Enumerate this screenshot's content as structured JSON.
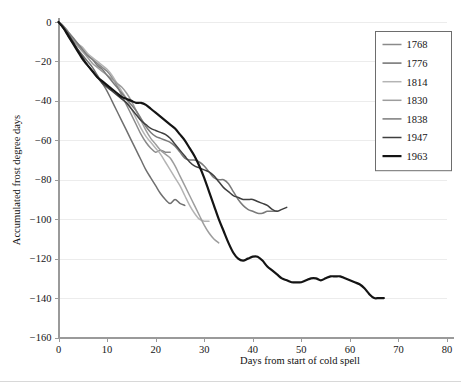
{
  "chart_data": {
    "type": "line",
    "title": "",
    "xlabel": "Days from start of cold spell",
    "ylabel": "Accumulated frost degree days",
    "xlim": [
      0,
      80
    ],
    "ylim": [
      -160,
      0
    ],
    "xticks": [
      0,
      10,
      20,
      30,
      40,
      50,
      60,
      70,
      80
    ],
    "yticks": [
      0,
      -20,
      -40,
      -60,
      -80,
      -100,
      -120,
      -140,
      -160
    ],
    "xtick_labels": [
      "0",
      "10",
      "20",
      "30",
      "40",
      "50",
      "60",
      "70",
      "80"
    ],
    "ytick_labels": [
      "0",
      "-20",
      "-40",
      "-60",
      "-80",
      "-100",
      "-120",
      "-140",
      "-160"
    ],
    "grid": "horizontal",
    "legend_position": "top-right",
    "series": [
      {
        "name": "1768",
        "color": "#8a8a8a",
        "width": 1.5,
        "points": [
          [
            0,
            0
          ],
          [
            1,
            -3
          ],
          [
            2,
            -6
          ],
          [
            3,
            -9
          ],
          [
            4,
            -12
          ],
          [
            5,
            -15
          ],
          [
            6,
            -17
          ],
          [
            7,
            -19
          ],
          [
            8,
            -21
          ],
          [
            9,
            -23
          ],
          [
            10,
            -25
          ],
          [
            11,
            -28
          ],
          [
            12,
            -32
          ],
          [
            13,
            -37
          ],
          [
            14,
            -42
          ],
          [
            15,
            -47
          ],
          [
            16,
            -52
          ],
          [
            17,
            -57
          ],
          [
            18,
            -61
          ],
          [
            19,
            -64
          ],
          [
            20,
            -66
          ],
          [
            21,
            -65
          ],
          [
            22,
            -66
          ],
          [
            23,
            -66
          ]
        ]
      },
      {
        "name": "1776",
        "color": "#6f6f6f",
        "width": 1.5,
        "points": [
          [
            0,
            0
          ],
          [
            1,
            -3
          ],
          [
            2,
            -7
          ],
          [
            3,
            -11
          ],
          [
            4,
            -14
          ],
          [
            5,
            -17
          ],
          [
            6,
            -20
          ],
          [
            7,
            -23
          ],
          [
            8,
            -27
          ],
          [
            9,
            -31
          ],
          [
            10,
            -35
          ],
          [
            11,
            -40
          ],
          [
            12,
            -45
          ],
          [
            13,
            -50
          ],
          [
            14,
            -55
          ],
          [
            15,
            -60
          ],
          [
            16,
            -65
          ],
          [
            17,
            -70
          ],
          [
            18,
            -75
          ],
          [
            19,
            -79
          ],
          [
            20,
            -83
          ],
          [
            21,
            -87
          ],
          [
            22,
            -90
          ],
          [
            23,
            -92
          ],
          [
            24,
            -90
          ],
          [
            25,
            -92
          ],
          [
            26,
            -93
          ]
        ]
      },
      {
        "name": "1814",
        "color": "#b4b4b4",
        "width": 1.5,
        "points": [
          [
            0,
            0
          ],
          [
            1,
            -2
          ],
          [
            2,
            -5
          ],
          [
            3,
            -8
          ],
          [
            4,
            -11
          ],
          [
            5,
            -13
          ],
          [
            6,
            -16
          ],
          [
            7,
            -18
          ],
          [
            8,
            -20
          ],
          [
            9,
            -22
          ],
          [
            10,
            -24
          ],
          [
            11,
            -27
          ],
          [
            12,
            -31
          ],
          [
            13,
            -35
          ],
          [
            14,
            -39
          ],
          [
            15,
            -44
          ],
          [
            16,
            -49
          ],
          [
            17,
            -54
          ],
          [
            18,
            -58
          ],
          [
            19,
            -61
          ],
          [
            20,
            -64
          ],
          [
            21,
            -67
          ],
          [
            22,
            -71
          ],
          [
            23,
            -75
          ],
          [
            24,
            -79
          ],
          [
            25,
            -83
          ],
          [
            26,
            -88
          ],
          [
            27,
            -93
          ],
          [
            28,
            -97
          ],
          [
            29,
            -100
          ],
          [
            30,
            -101
          ],
          [
            31,
            -101
          ]
        ]
      },
      {
        "name": "1830",
        "color": "#9d9d9d",
        "width": 1.5,
        "points": [
          [
            0,
            0
          ],
          [
            1,
            -3
          ],
          [
            2,
            -6
          ],
          [
            3,
            -9
          ],
          [
            4,
            -12
          ],
          [
            5,
            -15
          ],
          [
            6,
            -18
          ],
          [
            7,
            -21
          ],
          [
            8,
            -23
          ],
          [
            9,
            -25
          ],
          [
            10,
            -27
          ],
          [
            11,
            -29
          ],
          [
            12,
            -31
          ],
          [
            13,
            -33
          ],
          [
            14,
            -36
          ],
          [
            15,
            -40
          ],
          [
            16,
            -45
          ],
          [
            17,
            -50
          ],
          [
            18,
            -55
          ],
          [
            19,
            -59
          ],
          [
            20,
            -62
          ],
          [
            21,
            -65
          ],
          [
            22,
            -67
          ],
          [
            23,
            -69
          ],
          [
            24,
            -73
          ],
          [
            25,
            -78
          ],
          [
            26,
            -83
          ],
          [
            27,
            -88
          ],
          [
            28,
            -93
          ],
          [
            29,
            -98
          ],
          [
            30,
            -103
          ],
          [
            31,
            -107
          ],
          [
            32,
            -110
          ],
          [
            33,
            -112
          ]
        ]
      },
      {
        "name": "1838",
        "color": "#7b7b7b",
        "width": 1.5,
        "points": [
          [
            0,
            0
          ],
          [
            1,
            -2
          ],
          [
            2,
            -5
          ],
          [
            3,
            -8
          ],
          [
            4,
            -11
          ],
          [
            5,
            -14
          ],
          [
            6,
            -17
          ],
          [
            7,
            -19
          ],
          [
            8,
            -22
          ],
          [
            9,
            -24
          ],
          [
            10,
            -27
          ],
          [
            11,
            -30
          ],
          [
            12,
            -33
          ],
          [
            13,
            -36
          ],
          [
            14,
            -39
          ],
          [
            15,
            -42
          ],
          [
            16,
            -45
          ],
          [
            17,
            -49
          ],
          [
            18,
            -53
          ],
          [
            19,
            -56
          ],
          [
            20,
            -58
          ],
          [
            21,
            -59
          ],
          [
            22,
            -60
          ],
          [
            23,
            -61
          ],
          [
            24,
            -63
          ],
          [
            25,
            -66
          ],
          [
            26,
            -69
          ],
          [
            27,
            -70
          ],
          [
            28,
            -70
          ],
          [
            29,
            -71
          ],
          [
            30,
            -73
          ],
          [
            31,
            -76
          ],
          [
            32,
            -79
          ],
          [
            33,
            -80
          ],
          [
            34,
            -80
          ],
          [
            35,
            -82
          ],
          [
            36,
            -86
          ],
          [
            37,
            -90
          ],
          [
            38,
            -93
          ],
          [
            39,
            -95
          ],
          [
            40,
            -96
          ],
          [
            41,
            -97
          ],
          [
            42,
            -97
          ],
          [
            43,
            -96
          ],
          [
            44,
            -96
          ],
          [
            45,
            -96
          ]
        ]
      },
      {
        "name": "1947",
        "color": "#3f3f3f",
        "width": 1.5,
        "points": [
          [
            0,
            0
          ],
          [
            1,
            -3
          ],
          [
            2,
            -6
          ],
          [
            3,
            -10
          ],
          [
            4,
            -14
          ],
          [
            5,
            -18
          ],
          [
            6,
            -22
          ],
          [
            7,
            -25
          ],
          [
            8,
            -28
          ],
          [
            9,
            -31
          ],
          [
            10,
            -33
          ],
          [
            11,
            -35
          ],
          [
            12,
            -37
          ],
          [
            13,
            -39
          ],
          [
            14,
            -41
          ],
          [
            15,
            -44
          ],
          [
            16,
            -47
          ],
          [
            17,
            -50
          ],
          [
            18,
            -52
          ],
          [
            19,
            -54
          ],
          [
            20,
            -55
          ],
          [
            21,
            -56
          ],
          [
            22,
            -57
          ],
          [
            23,
            -59
          ],
          [
            24,
            -62
          ],
          [
            25,
            -65
          ],
          [
            26,
            -68
          ],
          [
            27,
            -71
          ],
          [
            28,
            -73
          ],
          [
            29,
            -74
          ],
          [
            30,
            -75
          ],
          [
            31,
            -76
          ],
          [
            32,
            -78
          ],
          [
            33,
            -81
          ],
          [
            34,
            -84
          ],
          [
            35,
            -86
          ],
          [
            36,
            -88
          ],
          [
            37,
            -89
          ],
          [
            38,
            -90
          ],
          [
            39,
            -90
          ],
          [
            40,
            -90
          ],
          [
            41,
            -91
          ],
          [
            42,
            -92
          ],
          [
            43,
            -93
          ],
          [
            44,
            -95
          ],
          [
            45,
            -96
          ],
          [
            46,
            -95
          ],
          [
            47,
            -94
          ]
        ]
      },
      {
        "name": "1963",
        "color": "#141414",
        "width": 2.2,
        "points": [
          [
            0,
            0
          ],
          [
            1,
            -3
          ],
          [
            2,
            -7
          ],
          [
            3,
            -11
          ],
          [
            4,
            -15
          ],
          [
            5,
            -19
          ],
          [
            6,
            -22
          ],
          [
            7,
            -25
          ],
          [
            8,
            -28
          ],
          [
            9,
            -30
          ],
          [
            10,
            -32
          ],
          [
            11,
            -34
          ],
          [
            12,
            -36
          ],
          [
            13,
            -38
          ],
          [
            14,
            -39
          ],
          [
            15,
            -40
          ],
          [
            16,
            -41
          ],
          [
            17,
            -41
          ],
          [
            18,
            -42
          ],
          [
            19,
            -44
          ],
          [
            20,
            -46
          ],
          [
            21,
            -48
          ],
          [
            22,
            -50
          ],
          [
            23,
            -52
          ],
          [
            24,
            -54
          ],
          [
            25,
            -57
          ],
          [
            26,
            -60
          ],
          [
            27,
            -64
          ],
          [
            28,
            -68
          ],
          [
            29,
            -73
          ],
          [
            30,
            -79
          ],
          [
            31,
            -86
          ],
          [
            32,
            -93
          ],
          [
            33,
            -100
          ],
          [
            34,
            -106
          ],
          [
            35,
            -112
          ],
          [
            36,
            -117
          ],
          [
            37,
            -120
          ],
          [
            38,
            -121
          ],
          [
            39,
            -120
          ],
          [
            40,
            -119
          ],
          [
            41,
            -119
          ],
          [
            42,
            -121
          ],
          [
            43,
            -124
          ],
          [
            44,
            -126
          ],
          [
            45,
            -128
          ],
          [
            46,
            -130
          ],
          [
            47,
            -131
          ],
          [
            48,
            -132
          ],
          [
            49,
            -132
          ],
          [
            50,
            -132
          ],
          [
            51,
            -131
          ],
          [
            52,
            -130
          ],
          [
            53,
            -130
          ],
          [
            54,
            -131
          ],
          [
            55,
            -130
          ],
          [
            56,
            -129
          ],
          [
            57,
            -129
          ],
          [
            58,
            -129
          ],
          [
            59,
            -130
          ],
          [
            60,
            -131
          ],
          [
            61,
            -132
          ],
          [
            62,
            -133
          ],
          [
            63,
            -135
          ],
          [
            64,
            -138
          ],
          [
            65,
            -140
          ],
          [
            66,
            -140
          ],
          [
            67,
            -140
          ]
        ]
      }
    ]
  },
  "legend": {
    "entries": [
      {
        "label": "1768"
      },
      {
        "label": "1776"
      },
      {
        "label": "1814"
      },
      {
        "label": "1830"
      },
      {
        "label": "1838"
      },
      {
        "label": "1947"
      },
      {
        "label": "1963"
      }
    ]
  }
}
